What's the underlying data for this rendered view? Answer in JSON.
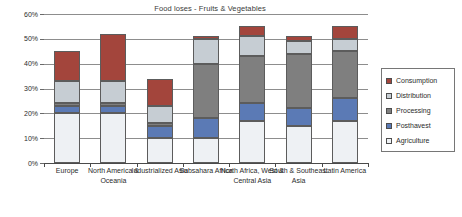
{
  "chart_data": {
    "type": "bar",
    "subtype": "stacked-bar",
    "title": "Food loses - Fruits & Vegetables",
    "xlabel": "",
    "ylabel": "",
    "ylim": [
      0,
      60
    ],
    "ytick_values": [
      0,
      10,
      20,
      30,
      40,
      50,
      60
    ],
    "ytick_labels": [
      "0%",
      "10%",
      "20%",
      "30%",
      "40%",
      "50%",
      "60%"
    ],
    "grid": true,
    "legend_position": "right",
    "categories": [
      "Europe",
      "North America & Oceania",
      "Industrialized Asia",
      "Subsahara Africa",
      "North Africa, West & Central Asia",
      "South & Southeast Asia",
      "Latin America"
    ],
    "series": [
      {
        "name": "Agriculture",
        "color": "#eef1f4",
        "values": [
          20,
          20,
          10,
          10,
          17,
          15,
          17
        ]
      },
      {
        "name": "Postharvest",
        "color": "#5b7ab5",
        "values": [
          3,
          3,
          5,
          8,
          7,
          7,
          9
        ]
      },
      {
        "name": "Processing",
        "color": "#7f7f7f",
        "values": [
          1,
          1,
          1,
          22,
          19,
          22,
          19
        ]
      },
      {
        "name": "Distribution",
        "color": "#c6cdd3",
        "values": [
          9,
          9,
          7,
          10,
          8,
          5,
          5
        ]
      },
      {
        "name": "Consumption",
        "color": "#a3453c",
        "values": [
          12,
          19,
          11,
          1,
          4,
          2,
          5
        ]
      }
    ],
    "totals": [
      45,
      52,
      34,
      51,
      55,
      51,
      55
    ]
  },
  "legend": {
    "items": [
      {
        "label": "Consumption"
      },
      {
        "label": "Distribution"
      },
      {
        "label": "Processing"
      },
      {
        "label": "Posthavest"
      },
      {
        "label": "Agriculture"
      }
    ]
  }
}
